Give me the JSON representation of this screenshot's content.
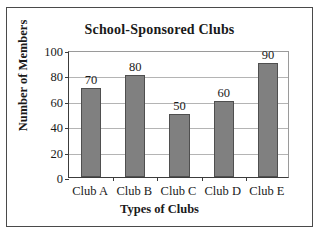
{
  "chart_data": {
    "type": "bar",
    "title": "School-Sponsored Clubs",
    "xlabel": "Types of Clubs",
    "ylabel": "Number of Members",
    "categories": [
      "Club A",
      "Club B",
      "Club C",
      "Club D",
      "Club E"
    ],
    "values": [
      70,
      80,
      50,
      60,
      90
    ],
    "data_labels": [
      "70",
      "80",
      "50",
      "60",
      "90"
    ],
    "ylim": [
      0,
      100
    ],
    "ytick_labels": [
      "0",
      "20",
      "40",
      "60",
      "80",
      "100"
    ],
    "ytick_values": [
      0,
      20,
      40,
      60,
      80,
      100
    ],
    "grid": true,
    "legend": "none",
    "colors": {
      "bar_fill": "#808080",
      "bar_border": "#4f4f4f",
      "gridline": "#b4b4b4",
      "axis": "#3c3c3c",
      "frame": "#4a4a4a",
      "background": "#ffffff",
      "text": "#1a1a1a"
    }
  }
}
